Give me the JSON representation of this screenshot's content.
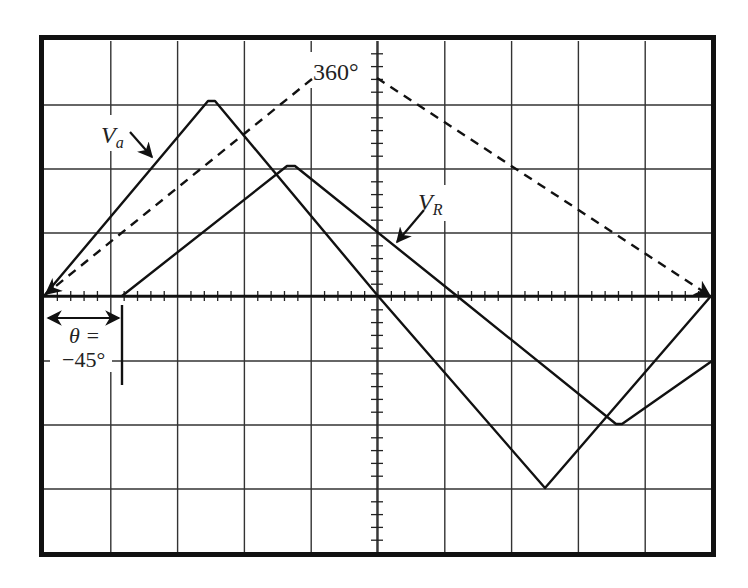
{
  "figure": {
    "type": "oscilloscope-trace",
    "labels": {
      "full_cycle": "360°",
      "va_main": "V",
      "va_sub": "a",
      "vr_main": "V",
      "vr_sub": "R",
      "theta_line1": "θ =",
      "theta_line2": "−45°"
    },
    "colors": {
      "frame": "#111111",
      "grid": "#333333",
      "trace": "#111111",
      "background": "#ffffff"
    }
  },
  "chart_data": {
    "type": "line",
    "title": "",
    "grid": {
      "horizontal_divisions": 10,
      "vertical_divisions": 8,
      "minor_ticks_per_division": 5
    },
    "xlim": [
      0,
      10
    ],
    "ylim": [
      -4,
      4
    ],
    "series": [
      {
        "name": "Va",
        "style": "solid",
        "points": [
          [
            0,
            0
          ],
          [
            2.5,
            3
          ],
          [
            5,
            0
          ],
          [
            7.5,
            -3
          ],
          [
            10,
            0
          ]
        ]
      },
      {
        "name": "VR",
        "style": "solid",
        "points": [
          [
            1.15,
            0
          ],
          [
            3.7,
            2
          ],
          [
            6.2,
            0
          ],
          [
            8.65,
            -2
          ],
          [
            10,
            -1
          ]
        ]
      },
      {
        "name": "360° reference",
        "style": "dashed",
        "points": [
          [
            0,
            0
          ],
          [
            5,
            3.4
          ],
          [
            10,
            0
          ]
        ]
      }
    ],
    "annotations": [
      {
        "text": "360°",
        "at": [
          4.1,
          3.4
        ]
      },
      {
        "text": "Va",
        "at": [
          0.9,
          2.4
        ],
        "arrow_to": [
          1.6,
          2.1
        ]
      },
      {
        "text": "VR",
        "at": [
          5.6,
          1.4
        ],
        "arrow_to": [
          5.3,
          0.8
        ]
      },
      {
        "text": "θ = −45°",
        "at": [
          0.5,
          -0.8
        ],
        "span": [
          0,
          1.15
        ]
      }
    ]
  }
}
